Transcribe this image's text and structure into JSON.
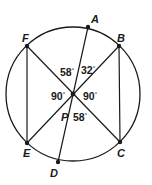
{
  "diagram": {
    "title": "",
    "colors": {
      "stroke": "#1a1a1a",
      "background": "#ffffff"
    },
    "circle": {
      "cx": 73,
      "cy": 94,
      "r": 67
    },
    "center_point": {
      "name": "P",
      "x": 73,
      "y": 94
    },
    "points": [
      {
        "name": "A",
        "x": 88,
        "y": 27,
        "label_x": 91,
        "label_y": 23
      },
      {
        "name": "B",
        "x": 119,
        "y": 46,
        "label_x": 119,
        "label_y": 42
      },
      {
        "name": "C",
        "x": 120,
        "y": 142,
        "label_x": 118,
        "label_y": 157
      },
      {
        "name": "D",
        "x": 58,
        "y": 162,
        "label_x": 51,
        "label_y": 176
      },
      {
        "name": "E",
        "x": 27,
        "y": 143,
        "label_x": 24,
        "label_y": 157
      },
      {
        "name": "F",
        "x": 27,
        "y": 46,
        "label_x": 22,
        "label_y": 42
      }
    ],
    "segments": [
      {
        "from": "A",
        "to": "D"
      },
      {
        "from": "F",
        "to": "C"
      },
      {
        "from": "B",
        "to": "E"
      },
      {
        "from": "F",
        "to": "E"
      },
      {
        "from": "B",
        "to": "C"
      }
    ],
    "labels": {
      "A": "A",
      "B": "B",
      "C": "C",
      "D": "D",
      "E": "E",
      "F": "F",
      "P": "P"
    },
    "angles": [
      {
        "id": "angle-fpa",
        "value": "58",
        "unit": "°",
        "x": 60,
        "y": 76
      },
      {
        "id": "angle-apb",
        "value": "32",
        "unit": "°",
        "x": 81,
        "y": 74
      },
      {
        "id": "angle-fpe",
        "value": "90",
        "unit": "°",
        "x": 51,
        "y": 100
      },
      {
        "id": "angle-bpc",
        "value": "90",
        "unit": "°",
        "x": 83,
        "y": 100
      },
      {
        "id": "angle-dpc",
        "value": "58",
        "unit": "°",
        "x": 73,
        "y": 121
      }
    ]
  }
}
